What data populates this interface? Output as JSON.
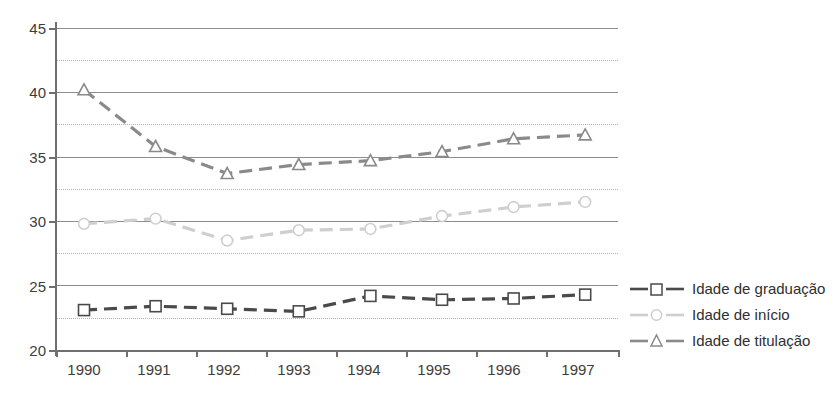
{
  "chart_data": {
    "type": "line",
    "title": "",
    "subtitle": "",
    "xlabel": "",
    "ylabel": "",
    "categories": [
      "1990",
      "1991",
      "1992",
      "1993",
      "1994",
      "1995",
      "1996",
      "1997"
    ],
    "ylim": [
      20,
      45
    ],
    "y_ticks": [
      20,
      25,
      30,
      35,
      40,
      45
    ],
    "y_minor_ticks": [
      22.5,
      27.5,
      32.5,
      37.5,
      42.5
    ],
    "grid": "horizontal-major-solid-and-minor-dotted",
    "legend_position": "right",
    "series": [
      {
        "name": "Idade de graduação",
        "marker": "square",
        "color": "#4a4a4a",
        "line_style": "dashed",
        "values": [
          23.1,
          23.4,
          23.2,
          23.0,
          24.2,
          23.9,
          24.0,
          24.3
        ]
      },
      {
        "name": "Idade  de início",
        "marker": "circle",
        "color": "#cfcfcf",
        "line_style": "dashed",
        "values": [
          29.8,
          30.2,
          28.5,
          29.3,
          29.4,
          30.4,
          31.1,
          31.5
        ]
      },
      {
        "name": "Idade  de titulação",
        "marker": "triangle",
        "color": "#8a8a8a",
        "line_style": "dashed",
        "values": [
          40.2,
          35.8,
          33.7,
          34.4,
          34.7,
          35.4,
          36.4,
          36.7
        ]
      }
    ]
  },
  "axis": {
    "y_labels": [
      "45",
      "40",
      "35",
      "30",
      "25",
      "20"
    ],
    "x_labels": [
      "1990",
      "1991",
      "1992",
      "1993",
      "1994",
      "1995",
      "1996",
      "1997"
    ]
  },
  "legend": {
    "items": [
      {
        "label": "Idade de graduação",
        "marker": "square-marker-icon",
        "color": "#4a4a4a"
      },
      {
        "label": "Idade  de início",
        "marker": "circle-marker-icon",
        "color": "#cfcfcf"
      },
      {
        "label": "Idade  de titulação",
        "marker": "triangle-marker-icon",
        "color": "#8a8a8a"
      }
    ]
  },
  "colors": {
    "axis": "#6f6f6f",
    "gridline_major": "#8d8d8d",
    "gridline_minor": "#c9a8a8",
    "background": "#ffffff",
    "text": "#3d3d3d"
  }
}
